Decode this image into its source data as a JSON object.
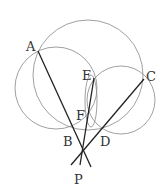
{
  "diagram": {
    "type": "geometry",
    "points": {
      "A": {
        "label": "A",
        "x": 38,
        "y": 51
      },
      "B": {
        "label": "B",
        "x": 72,
        "y": 127
      },
      "C": {
        "label": "C",
        "x": 144,
        "y": 79
      },
      "D": {
        "label": "D",
        "x": 102,
        "y": 128
      },
      "E": {
        "label": "E",
        "x": 94,
        "y": 78
      },
      "F": {
        "label": "F",
        "x": 89,
        "y": 115
      },
      "P": {
        "label": "P",
        "x": 82,
        "y": 153
      }
    },
    "circles": [
      {
        "name": "large",
        "cx": 88,
        "cy": 75,
        "r": 55
      },
      {
        "name": "left",
        "cx": 56,
        "cy": 88,
        "r": 41
      },
      {
        "name": "right",
        "cx": 121,
        "cy": 100,
        "r": 34
      },
      {
        "name": "inner",
        "cx": 91,
        "cy": 102,
        "r": 12
      }
    ],
    "segments": [
      "AP",
      "CP",
      "EP"
    ]
  }
}
